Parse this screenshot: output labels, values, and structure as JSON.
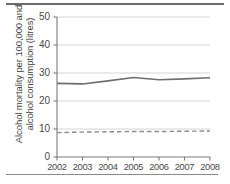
{
  "chart_data": {
    "type": "line",
    "title": "",
    "xlabel": "",
    "ylabel": "Alcohol mortality per 100,000 and alcohol consumption (litres)",
    "ylabel_line1": "Alcohol mortality per 100,000 and",
    "ylabel_line2": "alcohol consumption (litres)",
    "categories": [
      "2002",
      "2003",
      "2004",
      "2005",
      "2006",
      "2007",
      "2008"
    ],
    "x": [
      2002,
      2003,
      2004,
      2005,
      2006,
      2007,
      2008
    ],
    "xlim": [
      2002,
      2008
    ],
    "ylim": [
      0,
      50
    ],
    "yticks": [
      0,
      10,
      20,
      30,
      40,
      50
    ],
    "ytick_labels": [
      "0",
      "10",
      "20",
      "30",
      "40",
      "50"
    ],
    "xtick_labels": [
      "2002",
      "2003",
      "2004",
      "2005",
      "2006",
      "2007",
      "2008"
    ],
    "grid": true,
    "grid_axis": "y",
    "legend": false,
    "series": [
      {
        "name": "Alcohol mortality per 100,000",
        "style": "solid",
        "color": "#6e6e6e",
        "values": [
          26.3,
          26.1,
          27.2,
          28.4,
          27.6,
          27.9,
          28.3
        ]
      },
      {
        "name": "Alcohol consumption (litres)",
        "style": "dashed",
        "color": "#8c8c8c",
        "values": [
          8.7,
          8.9,
          9.0,
          9.1,
          9.1,
          9.2,
          9.3
        ]
      }
    ]
  },
  "figure": {
    "axis_color": "#7a7a7a",
    "grid_color": "#e3e3e3",
    "rule_color": "#6b6b6b"
  }
}
